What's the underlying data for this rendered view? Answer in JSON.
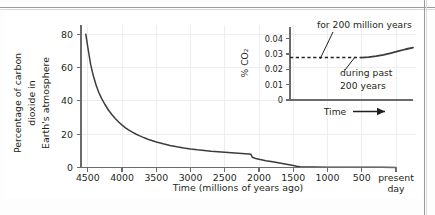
{
  "figure": {
    "background_color": "#ffffff",
    "plate_color": "#fdfdfd",
    "rule_color": "#9a9a9a",
    "ink_color": "#231f20",
    "grid_color": "#eceef0",
    "curve_color": "#3c3c3c"
  },
  "chart_data": [
    {
      "id": "main",
      "type": "line",
      "title": "",
      "xlabel": "Time (millions of years ago)",
      "ylabel": "Percentage of carbon dioxide in Earth's atmosphere",
      "ylabel_lines": [
        "Percentage of carbon",
        "dioxide in",
        "Earth's atmosphere"
      ],
      "xticks": [
        4500,
        4000,
        3500,
        3000,
        2500,
        2000,
        1500,
        1000,
        500
      ],
      "xtick_labels": [
        "4500",
        "4000",
        "3500",
        "3000",
        "2500",
        "2000",
        "1500",
        "1000",
        "500"
      ],
      "xtick_extra_label_lines": [
        "present",
        "day"
      ],
      "xtick_extra_value": 0,
      "yticks": [
        0,
        20,
        40,
        60,
        80
      ],
      "ytick_labels": [
        "0",
        "20",
        "40",
        "60",
        "80"
      ],
      "xlim": [
        4600,
        0
      ],
      "ylim": [
        0,
        84
      ],
      "x_axis_direction": "decreasing",
      "grid": true,
      "legend": "none",
      "x": [
        4530,
        4500,
        4460,
        4420,
        4380,
        4340,
        4300,
        4250,
        4200,
        4150,
        4100,
        4050,
        4000,
        3950,
        3900,
        3850,
        3800,
        3750,
        3700,
        3650,
        3600,
        3500,
        3400,
        3300,
        3200,
        3100,
        3000,
        2900,
        2800,
        2700,
        2600,
        2500,
        2400,
        2300,
        2200,
        2150,
        2120,
        2100,
        2080,
        2050,
        2000,
        1900,
        1800,
        1700,
        1600,
        1500,
        1450,
        1400,
        1300,
        1200,
        1000,
        800,
        600,
        400,
        200,
        0
      ],
      "y": [
        80.0,
        72.0,
        62.0,
        55.0,
        49.5,
        45.0,
        41.5,
        37.8,
        34.5,
        31.8,
        29.4,
        27.3,
        25.4,
        23.8,
        22.4,
        21.2,
        20.1,
        19.1,
        18.2,
        17.4,
        16.6,
        15.3,
        14.2,
        13.2,
        12.4,
        11.7,
        11.1,
        10.6,
        10.2,
        9.8,
        9.5,
        9.2,
        8.9,
        8.6,
        8.3,
        8.1,
        8.0,
        6.3,
        5.8,
        5.4,
        4.9,
        4.1,
        3.4,
        2.7,
        2.0,
        1.2,
        0.8,
        0.5,
        0.35,
        0.28,
        0.2,
        0.16,
        0.12,
        0.1,
        0.08,
        0.06
      ],
      "annotations": []
    },
    {
      "id": "inset",
      "type": "line",
      "title": "",
      "xlabel": "Time",
      "xlabel_arrow": "→",
      "ylabel": "% CO₂",
      "yticks": [
        0,
        0.01,
        0.02,
        0.03,
        0.04
      ],
      "ytick_labels": [
        "0",
        "0.01",
        "0.02",
        "0.03",
        "0.04"
      ],
      "ylim": [
        0,
        0.045
      ],
      "xlim": [
        0,
        1
      ],
      "grid": false,
      "legend": "none",
      "series": [
        {
          "name": "for 200 million years",
          "style": "dashed",
          "x": [
            0.0,
            0.1,
            0.2,
            0.3,
            0.4,
            0.5,
            0.58
          ],
          "y": [
            0.0277,
            0.0277,
            0.0277,
            0.0277,
            0.0277,
            0.0277,
            0.0277
          ]
        },
        {
          "name": "during past 200 years",
          "style": "solid",
          "x": [
            0.58,
            0.64,
            0.7,
            0.76,
            0.82,
            0.88,
            0.94,
            1.0
          ],
          "y": [
            0.0277,
            0.028,
            0.0286,
            0.0294,
            0.0305,
            0.0318,
            0.0331,
            0.0342
          ]
        }
      ],
      "annotations": [
        {
          "id": "ann-200-million",
          "text": "for 200 million years",
          "lines": [
            "for 200 million years"
          ],
          "target_series": "for 200 million years"
        },
        {
          "id": "ann-past-200",
          "text": "during past 200 years",
          "lines": [
            "during past",
            "200 years"
          ],
          "target_series": "during past 200 years"
        }
      ]
    }
  ]
}
